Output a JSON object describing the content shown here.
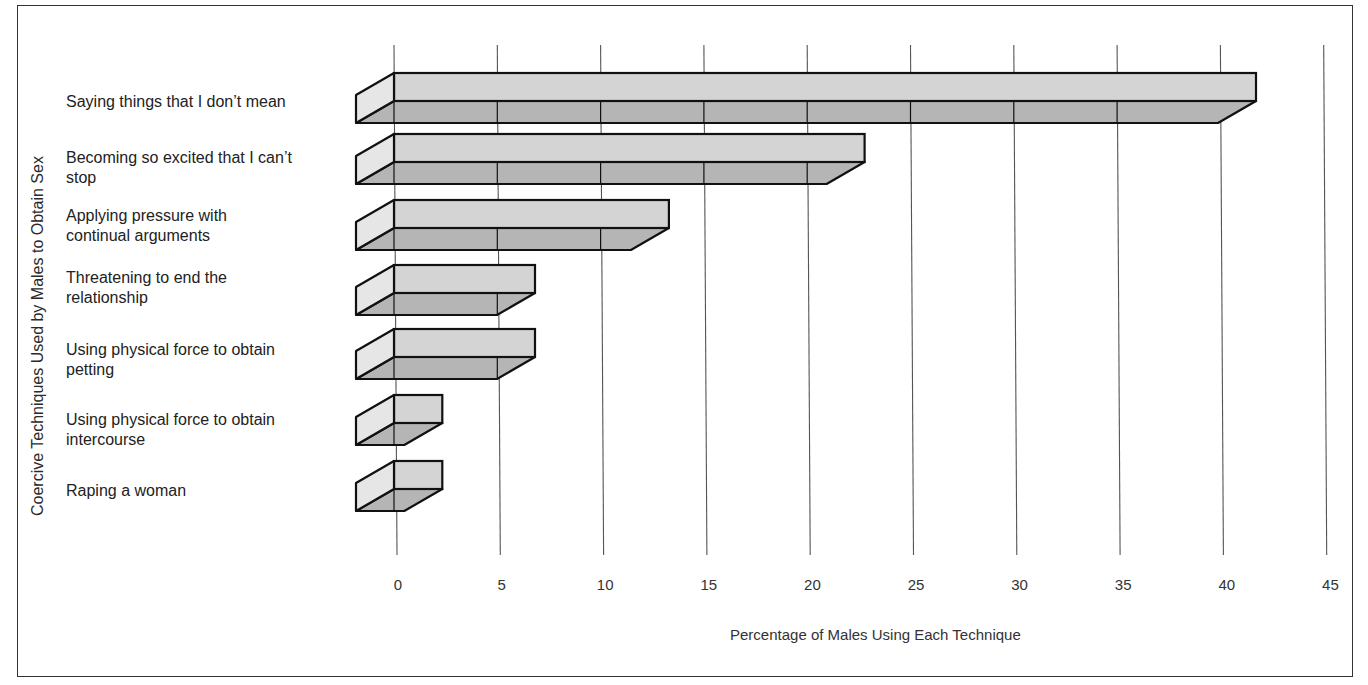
{
  "chart_data": {
    "type": "bar",
    "orientation": "horizontal",
    "style": "3d",
    "title": "",
    "xlabel": "Percentage of Males Using Each Technique",
    "ylabel": "Coercive Techniques Used by Males to Obtain Sex",
    "xlim": [
      0,
      45
    ],
    "xticks": [
      "0",
      "5",
      "10",
      "15",
      "20",
      "25",
      "30",
      "35",
      "40",
      "45"
    ],
    "grid": "vertical",
    "categories": [
      "Saying things that I don’t mean",
      "Becoming so excited that I can’t stop",
      "Applying pressure with continual arguments",
      "Threatening to end the relationship",
      "Using physical force to obtain petting",
      "Using physical force to obtain intercourse",
      "Raping a woman"
    ],
    "values": [
      40,
      21,
      11.5,
      5,
      5,
      0.5,
      0.5
    ]
  },
  "labels": {
    "ylabel": "Coercive Techniques Used by Males to Obtain Sex",
    "xlabel": "Percentage of Males Using Each Technique",
    "categories": [
      [
        "Saying things that I don’t mean"
      ],
      [
        "Becoming so excited that I can’t",
        "stop"
      ],
      [
        "Applying pressure with",
        "continual arguments"
      ],
      [
        "Threatening to end the",
        "relationship"
      ],
      [
        "Using physical force to obtain",
        "petting"
      ],
      [
        "Using physical force to obtain",
        "intercourse"
      ],
      [
        "Raping a woman"
      ]
    ],
    "ticks": [
      "0",
      "5",
      "10",
      "15",
      "20",
      "25",
      "30",
      "35",
      "40",
      "45"
    ]
  },
  "colors": {
    "face_top": "#d4d4d4",
    "face_bottom": "#b5b5b5",
    "face_side": "#e6e6e6",
    "outline": "#111111",
    "grid": "#555555"
  }
}
